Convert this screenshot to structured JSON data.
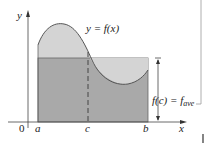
{
  "figure": {
    "y_axis_label": "y",
    "x_axis_label": "x",
    "origin_label": "0",
    "curve_label": "y = f(x)",
    "height_label_main": "f(c) = f",
    "height_label_sub": "ave",
    "tick_labels": {
      "a": "a",
      "c": "c",
      "b": "b"
    },
    "colors": {
      "curve_region_fill": "#d4d4d4",
      "rectangle_fill": "#a9a9a9",
      "lines": "#555555",
      "background": "#ffffff"
    }
  }
}
